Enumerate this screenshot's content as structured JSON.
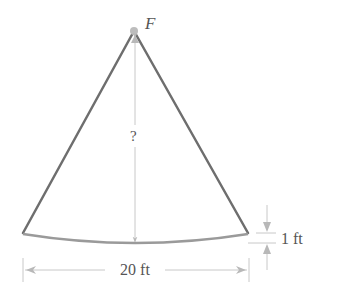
{
  "diagram": {
    "type": "pendulum-arc-geometry",
    "labels": {
      "apex": "F",
      "height": "?",
      "sag": "1 ft",
      "span": "20 ft"
    },
    "colors": {
      "cable": "#6e6e6e",
      "arc": "#9a9a9a",
      "dimension": "#b8b8b8",
      "point": "#bdbdbd",
      "text": "#555555"
    }
  }
}
